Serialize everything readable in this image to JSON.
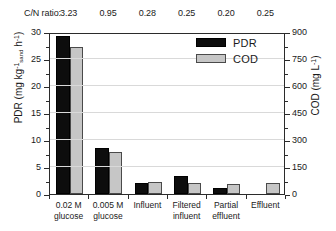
{
  "header": {
    "cn_label": "C/N ratio:",
    "cn_values": [
      "3.23",
      "0.95",
      "0.28",
      "0.25",
      "0.20",
      "0.25"
    ]
  },
  "legend": {
    "items": [
      {
        "label": "PDR",
        "color": "#0d0d0d",
        "name": "legend-pdr"
      },
      {
        "label": "COD",
        "color": "#c6c6c6",
        "name": "legend-cod"
      }
    ]
  },
  "axes": {
    "left_title_main": "PDR (mg kg",
    "left_title": "PDR (mg kg⁻¹sand h⁻¹)",
    "right_title": "COD (mg L⁻¹)",
    "left_ticks": [
      "30",
      "25",
      "20",
      "15",
      "10",
      "5",
      "0"
    ],
    "right_ticks": [
      "900",
      "750",
      "600",
      "450",
      "300",
      "150",
      "0"
    ]
  },
  "chart_data": {
    "type": "bar",
    "title": "",
    "xlabel": "",
    "ylabel": "PDR (mg kg-1 sand h-1)",
    "y2label": "COD (mg L-1)",
    "ylim": [
      0,
      30
    ],
    "y2lim": [
      0,
      900
    ],
    "grid": true,
    "legend_position": "top-right",
    "categories": [
      "0.02 M glucose",
      "0.005 M glucose",
      "Influent",
      "Filtered influent",
      "Partial effluent",
      "Effluent"
    ],
    "category_lines": [
      [
        "0.02 M",
        "glucose"
      ],
      [
        "0.005 M",
        "glucose"
      ],
      [
        "Influent",
        ""
      ],
      [
        "Filtered",
        "influent"
      ],
      [
        "Partial",
        "effluent"
      ],
      [
        "Effluent",
        ""
      ]
    ],
    "cn_ratio": [
      3.23,
      0.95,
      0.28,
      0.25,
      0.2,
      0.25
    ],
    "series": [
      {
        "name": "PDR",
        "axis": "left",
        "unit": "mg kg-1 sand h-1",
        "color": "#0d0d0d",
        "values": [
          29.3,
          8.5,
          2.0,
          3.4,
          1.2,
          0.0
        ]
      },
      {
        "name": "COD",
        "axis": "right",
        "unit": "mg L-1",
        "color": "#c6c6c6",
        "values": [
          816,
          231,
          69,
          63,
          54,
          63
        ]
      }
    ]
  }
}
